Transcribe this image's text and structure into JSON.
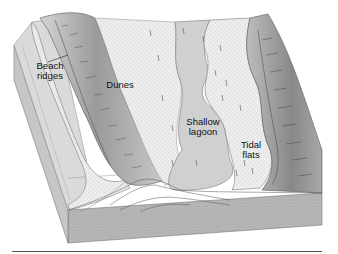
{
  "figure": {
    "type": "block-diagram",
    "labels": [
      {
        "id": "beach-ridges",
        "text": "Beach\nridges"
      },
      {
        "id": "dunes",
        "text": "Dunes"
      },
      {
        "id": "shallow-lagoon",
        "text": "Shallow\nlagoon"
      },
      {
        "id": "tidal-flats",
        "text": "Tidal\nflats"
      }
    ]
  },
  "colors": {
    "sea_floor": "#d9d9d9",
    "beach": "#ececec",
    "dune_dark": "#8a8a8a",
    "dune_light": "#c8c8c8",
    "lagoon": "#cfcfcf",
    "tidal_flat": "#e8e8e8",
    "mainland_dark": "#8f8f8f",
    "block_side": "#b4b4b4",
    "block_front": "#bdbdbd",
    "line": "#3a3a3a"
  }
}
